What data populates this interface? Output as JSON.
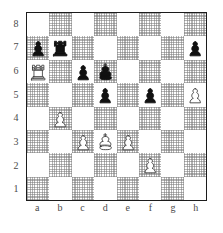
{
  "board": {
    "orientation": "white-bottom",
    "files": [
      "a",
      "b",
      "c",
      "d",
      "e",
      "f",
      "g",
      "h"
    ],
    "ranks": [
      "8",
      "7",
      "6",
      "5",
      "4",
      "3",
      "2",
      "1"
    ],
    "colors": {
      "light_square": "#ffffff",
      "dark_square": "#d9d9d9",
      "border": "#1c1c1c",
      "label": "#4a4a4a",
      "white_piece_fill": "#ffffff",
      "white_piece_outline": "#333333",
      "black_piece_fill": "#111111"
    },
    "position_fen": "8/pr5p/R1pk4/3p1p1P/1P6/2PKP3/5P2/8",
    "piece_names": {
      "P": "white-pawn",
      "R": "white-rook",
      "K": "white-king",
      "p": "black-pawn",
      "r": "black-rook",
      "k": "black-king"
    },
    "pieces": [
      {
        "square": "a7",
        "piece": "p",
        "name": "black-pawn",
        "color": "black",
        "type": "pawn",
        "file": 0,
        "rank": 1
      },
      {
        "square": "b7",
        "piece": "r",
        "name": "black-rook",
        "color": "black",
        "type": "rook",
        "file": 1,
        "rank": 1
      },
      {
        "square": "h7",
        "piece": "p",
        "name": "black-pawn",
        "color": "black",
        "type": "pawn",
        "file": 7,
        "rank": 1
      },
      {
        "square": "a6",
        "piece": "R",
        "name": "white-rook",
        "color": "white",
        "type": "rook",
        "file": 0,
        "rank": 2
      },
      {
        "square": "c6",
        "piece": "p",
        "name": "black-pawn",
        "color": "black",
        "type": "pawn",
        "file": 2,
        "rank": 2
      },
      {
        "square": "d6",
        "piece": "k",
        "name": "black-king",
        "color": "black",
        "type": "king",
        "file": 3,
        "rank": 2
      },
      {
        "square": "d5",
        "piece": "p",
        "name": "black-pawn",
        "color": "black",
        "type": "pawn",
        "file": 3,
        "rank": 3
      },
      {
        "square": "f5",
        "piece": "p",
        "name": "black-pawn",
        "color": "black",
        "type": "pawn",
        "file": 5,
        "rank": 3
      },
      {
        "square": "h5",
        "piece": "P",
        "name": "white-pawn",
        "color": "white",
        "type": "pawn",
        "file": 7,
        "rank": 3
      },
      {
        "square": "b4",
        "piece": "P",
        "name": "white-pawn",
        "color": "white",
        "type": "pawn",
        "file": 1,
        "rank": 4
      },
      {
        "square": "c3",
        "piece": "P",
        "name": "white-pawn",
        "color": "white",
        "type": "pawn",
        "file": 2,
        "rank": 5
      },
      {
        "square": "d3",
        "piece": "K",
        "name": "white-king",
        "color": "white",
        "type": "king",
        "file": 3,
        "rank": 5
      },
      {
        "square": "e3",
        "piece": "P",
        "name": "white-pawn",
        "color": "white",
        "type": "pawn",
        "file": 4,
        "rank": 5
      },
      {
        "square": "f2",
        "piece": "P",
        "name": "white-pawn",
        "color": "white",
        "type": "pawn",
        "file": 5,
        "rank": 6
      }
    ]
  }
}
